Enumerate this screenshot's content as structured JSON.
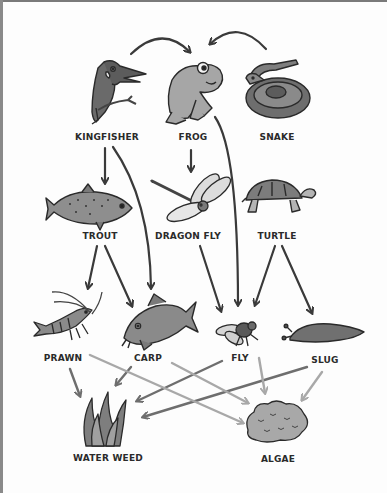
{
  "diagram": {
    "type": "food-web",
    "colors": {
      "line_dark": "#3a3a3a",
      "line_mid": "#6e6e6e",
      "line_light": "#a8a8a8",
      "fill_dark": "#5a5a5a",
      "fill_mid": "#8c8c8c",
      "fill_light": "#c4c4c4"
    },
    "organisms": [
      {
        "id": "kingfisher",
        "label": "KINGFISHER",
        "icon": "kingfisher-icon"
      },
      {
        "id": "frog",
        "label": "FROG",
        "icon": "frog-icon"
      },
      {
        "id": "snake",
        "label": "SNAKE",
        "icon": "snake-icon"
      },
      {
        "id": "trout",
        "label": "TROUT",
        "icon": "trout-icon"
      },
      {
        "id": "dragonfly",
        "label": "DRAGON FLY",
        "icon": "dragonfly-icon"
      },
      {
        "id": "turtle",
        "label": "TURTLE",
        "icon": "turtle-icon"
      },
      {
        "id": "prawn",
        "label": "PRAWN",
        "icon": "prawn-icon"
      },
      {
        "id": "carp",
        "label": "CARP",
        "icon": "carp-icon"
      },
      {
        "id": "fly",
        "label": "FLY",
        "icon": "fly-icon"
      },
      {
        "id": "slug",
        "label": "SLUG",
        "icon": "slug-icon"
      },
      {
        "id": "waterweed",
        "label": "WATER WEED",
        "icon": "water-weed-icon"
      },
      {
        "id": "algae",
        "label": "ALGAE",
        "icon": "algae-icon"
      }
    ],
    "arrows": [
      {
        "from": "kingfisher",
        "to": "frog"
      },
      {
        "from": "snake",
        "to": "frog"
      },
      {
        "from": "kingfisher",
        "to": "trout"
      },
      {
        "from": "kingfisher",
        "to": "carp"
      },
      {
        "from": "frog",
        "to": "dragonfly"
      },
      {
        "from": "frog",
        "to": "fly"
      },
      {
        "from": "trout",
        "to": "prawn"
      },
      {
        "from": "trout",
        "to": "carp"
      },
      {
        "from": "dragonfly",
        "to": "fly"
      },
      {
        "from": "turtle",
        "to": "fly"
      },
      {
        "from": "turtle",
        "to": "slug"
      },
      {
        "from": "prawn",
        "to": "waterweed"
      },
      {
        "from": "prawn",
        "to": "algae"
      },
      {
        "from": "carp",
        "to": "waterweed"
      },
      {
        "from": "carp",
        "to": "algae"
      },
      {
        "from": "fly",
        "to": "waterweed"
      },
      {
        "from": "fly",
        "to": "algae"
      },
      {
        "from": "slug",
        "to": "waterweed"
      },
      {
        "from": "slug",
        "to": "algae"
      }
    ]
  }
}
